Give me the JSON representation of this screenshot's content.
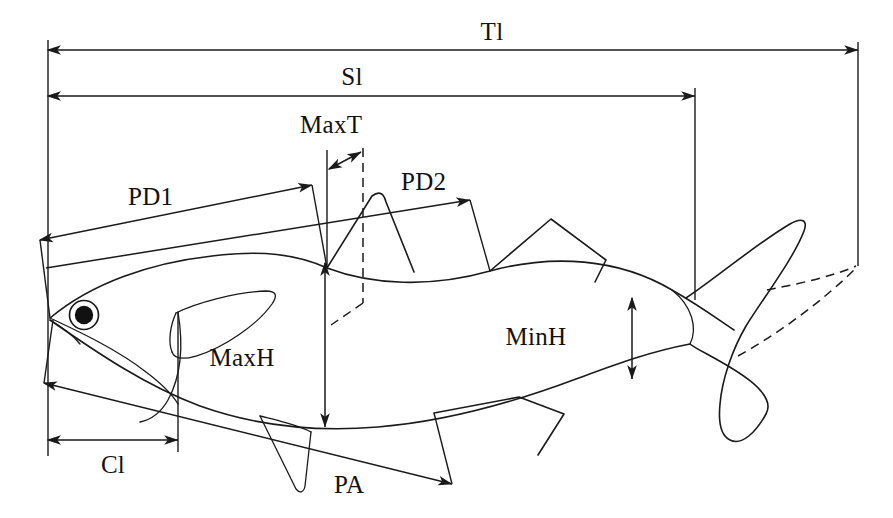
{
  "figure": {
    "background_color": "#ffffff",
    "ink_color": "#1a1a1a",
    "width": 893,
    "height": 518
  },
  "measurements": [
    {
      "id": "tl",
      "label": "Tl",
      "name": "total-length",
      "orientation": "horizontal",
      "label_x": 492,
      "label_y": 40
    },
    {
      "id": "sl",
      "label": "Sl",
      "name": "standard-length",
      "orientation": "horizontal",
      "label_x": 352,
      "label_y": 85
    },
    {
      "id": "maxt",
      "label": "MaxT",
      "name": "maximum-thickness",
      "orientation": "horizontal",
      "label_x": 300,
      "label_y": 133
    },
    {
      "id": "pd1",
      "label": "PD1",
      "name": "pre-dorsal-1-distance",
      "orientation": "oblique",
      "label_x": 128,
      "label_y": 205
    },
    {
      "id": "pd2",
      "label": "PD2",
      "name": "pre-dorsal-2-distance",
      "orientation": "oblique",
      "label_x": 401,
      "label_y": 190
    },
    {
      "id": "maxh",
      "label": "MaxH",
      "name": "maximum-height",
      "orientation": "vertical",
      "label_x": 242,
      "label_y": 366
    },
    {
      "id": "minh",
      "label": "MinH",
      "name": "minimum-height",
      "orientation": "vertical",
      "label_x": 536,
      "label_y": 345
    },
    {
      "id": "cl",
      "label": "Cl",
      "name": "cephalic-length",
      "orientation": "horizontal",
      "label_x": 100,
      "label_y": 473
    },
    {
      "id": "pa",
      "label": "PA",
      "name": "pre-anal-distance",
      "orientation": "oblique",
      "label_x": 334,
      "label_y": 493
    }
  ],
  "anatomy": [
    {
      "name": "body-outline",
      "label": "body outline"
    },
    {
      "name": "head-outline",
      "label": "head"
    },
    {
      "name": "eye",
      "label": "eye"
    },
    {
      "name": "operculum",
      "label": "operculum"
    },
    {
      "name": "pectoral-fin",
      "label": "pectoral fin"
    },
    {
      "name": "pelvic-fin",
      "label": "pelvic fin"
    },
    {
      "name": "dorsal-fin",
      "label": "dorsal fin"
    },
    {
      "name": "adipose-fin",
      "label": "adipose fin"
    },
    {
      "name": "anal-fin",
      "label": "anal fin"
    },
    {
      "name": "caudal-fin",
      "label": "caudal fin"
    },
    {
      "name": "caudal-fin-spread-dashed",
      "label": "caudal fin spread outline"
    }
  ]
}
